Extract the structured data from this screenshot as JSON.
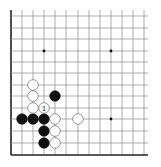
{
  "caption": "",
  "board": {
    "colors": {
      "background": "#ffffff",
      "grid": "#8a8a8a",
      "edge": "#222222",
      "black_stone": "#111111",
      "white_stone": "#ffffff",
      "white_stone_border": "#555555",
      "star": "#111111"
    },
    "columns_x": [
      11,
      22,
      33,
      44,
      55,
      66,
      78,
      89,
      100,
      111,
      122,
      133,
      144
    ],
    "rows_y": [
      155,
      143,
      131,
      119,
      108,
      96,
      85,
      73,
      62,
      51,
      39,
      28,
      16
    ],
    "line_extent": {
      "x_min": 11,
      "x_max": 148,
      "y_min": 10,
      "y_max": 155
    },
    "edges": [
      "left",
      "bottom"
    ],
    "star_points": [
      {
        "col": 3,
        "row": 9
      },
      {
        "col": 9,
        "row": 9
      },
      {
        "col": 9,
        "row": 3
      }
    ],
    "stones": [
      {
        "color": "black",
        "col": 1,
        "row": 3
      },
      {
        "color": "black",
        "col": 2,
        "row": 3
      },
      {
        "color": "black",
        "col": 3,
        "row": 3
      },
      {
        "color": "black",
        "col": 3,
        "row": 2
      },
      {
        "color": "black",
        "col": 3,
        "row": 1
      },
      {
        "color": "black",
        "col": 4,
        "row": 5
      },
      {
        "color": "white",
        "col": 4,
        "row": 3
      },
      {
        "color": "white",
        "col": 4,
        "row": 2
      },
      {
        "color": "white",
        "col": 4,
        "row": 1
      },
      {
        "color": "white",
        "col": 6,
        "row": 3
      },
      {
        "color": "white",
        "col": 2,
        "row": 4
      },
      {
        "color": "white",
        "col": 2,
        "row": 5
      },
      {
        "color": "white",
        "col": 2,
        "row": 6
      },
      {
        "color": "white",
        "col": 3,
        "row": 4,
        "label": "1"
      }
    ],
    "stone_radius": 5.3
  }
}
